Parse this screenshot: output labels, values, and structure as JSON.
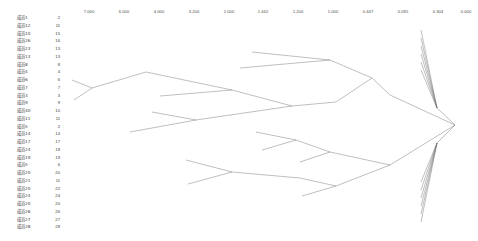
{
  "chart_data": {
    "type": "line",
    "chart_kind": "dendrogram",
    "title": "",
    "subtitle": "",
    "xlabel": "",
    "ylabel": "",
    "orientation": "horizontal-right-root",
    "link_style": "slanted",
    "grid": false,
    "legend": null,
    "line_color": "#6f6f6f",
    "axis": {
      "label": "",
      "direction": "descending-left-to-right",
      "range": [
        7.0,
        0.0
      ],
      "tick_labels": [
        "7.000",
        "6.000",
        "4.000",
        "3.200",
        "2.000",
        "1.442",
        "1.200",
        "1.000",
        "0.447",
        "0.092",
        "0.304",
        "0.000"
      ],
      "tick_values": [
        7.0,
        6.0,
        4.0,
        3.2,
        2.0,
        1.442,
        1.2,
        1.0,
        0.447,
        0.092,
        0.304,
        0.0
      ],
      "tick_x_px": [
        89,
        124,
        159,
        194,
        229,
        263,
        298,
        333,
        368,
        403,
        438,
        466
      ]
    },
    "leaf_count": 28,
    "categories": [
      "成员1",
      "成员12",
      "成员10",
      "成员26",
      "成员23",
      "成员13",
      "成员8",
      "成员4",
      "成员6",
      "成员7",
      "成员3",
      "成员9",
      "成员40",
      "成员11",
      "成员5",
      "成员14",
      "成员17",
      "成员24",
      "成员19",
      "成员5",
      "成员20",
      "成员21",
      "成员20",
      "成员24",
      "成员20",
      "成员26",
      "成员27",
      "成员28"
    ],
    "values": [
      2,
      11,
      15,
      16,
      13,
      13,
      8,
      4,
      6,
      7,
      3,
      9,
      10,
      11,
      2,
      14,
      17,
      18,
      19,
      6,
      20,
      11,
      22,
      24,
      20,
      26,
      27,
      28
    ],
    "series": [
      {
        "name": "leaf-index",
        "values": [
          2,
          11,
          15,
          16,
          13,
          13,
          8,
          4,
          6,
          7,
          3,
          9,
          10,
          11,
          2,
          14,
          17,
          18,
          19,
          6,
          20,
          11,
          22,
          24,
          20,
          26,
          27,
          28
        ]
      }
    ]
  },
  "leaves": [
    {
      "label": "成员1",
      "index": "2"
    },
    {
      "label": "成员12",
      "index": "11"
    },
    {
      "label": "成员10",
      "index": "15"
    },
    {
      "label": "成员26",
      "index": "16"
    },
    {
      "label": "成员23",
      "index": "13"
    },
    {
      "label": "成员13",
      "index": "13"
    },
    {
      "label": "成员8",
      "index": "8"
    },
    {
      "label": "成员4",
      "index": "4"
    },
    {
      "label": "成员6",
      "index": "6"
    },
    {
      "label": "成员7",
      "index": "7"
    },
    {
      "label": "成员3",
      "index": "3"
    },
    {
      "label": "成员9",
      "index": "9"
    },
    {
      "label": "成员40",
      "index": "10"
    },
    {
      "label": "成员11",
      "index": "11"
    },
    {
      "label": "成员5",
      "index": "2"
    },
    {
      "label": "成员14",
      "index": "14"
    },
    {
      "label": "成员17",
      "index": "17"
    },
    {
      "label": "成员24",
      "index": "18"
    },
    {
      "label": "成员19",
      "index": "19"
    },
    {
      "label": "成员5",
      "index": "6"
    },
    {
      "label": "成员20",
      "index": "20"
    },
    {
      "label": "成员21",
      "index": "11"
    },
    {
      "label": "成员20",
      "index": "22"
    },
    {
      "label": "成员24",
      "index": "24"
    },
    {
      "label": "成员20",
      "index": "20"
    },
    {
      "label": "成员26",
      "index": "26"
    },
    {
      "label": "成员27",
      "index": "27"
    },
    {
      "label": "成员28",
      "index": "28"
    }
  ],
  "tree": {
    "root": {
      "x": 455,
      "y": 125
    },
    "segments": [
      [
        455,
        125,
        437,
        108
      ],
      [
        437,
        108,
        421,
        30
      ],
      [
        437,
        108,
        421,
        38
      ],
      [
        437,
        108,
        421,
        46
      ],
      [
        437,
        108,
        421,
        54
      ],
      [
        437,
        108,
        421,
        62
      ],
      [
        437,
        108,
        421,
        70
      ],
      [
        455,
        125,
        437,
        143
      ],
      [
        437,
        143,
        421,
        182
      ],
      [
        437,
        143,
        421,
        190
      ],
      [
        437,
        143,
        421,
        198
      ],
      [
        437,
        143,
        421,
        206
      ],
      [
        437,
        143,
        421,
        214
      ],
      [
        437,
        143,
        421,
        222
      ],
      [
        455,
        125,
        390,
        95
      ],
      [
        455,
        125,
        390,
        165
      ],
      [
        390,
        95,
        372,
        78
      ],
      [
        372,
        78,
        330,
        60
      ],
      [
        372,
        78,
        336,
        102
      ],
      [
        330,
        60,
        240,
        68
      ],
      [
        330,
        60,
        252,
        52
      ],
      [
        336,
        102,
        292,
        106
      ],
      [
        292,
        106,
        196,
        120
      ],
      [
        292,
        106,
        232,
        90
      ],
      [
        232,
        90,
        146,
        72
      ],
      [
        232,
        90,
        160,
        96
      ],
      [
        196,
        120,
        130,
        132
      ],
      [
        196,
        120,
        152,
        112
      ],
      [
        146,
        72,
        92,
        88
      ],
      [
        92,
        88,
        72,
        80
      ],
      [
        92,
        88,
        74,
        100
      ],
      [
        390,
        165,
        330,
        152
      ],
      [
        390,
        165,
        336,
        186
      ],
      [
        330,
        152,
        296,
        140
      ],
      [
        330,
        152,
        300,
        162
      ],
      [
        296,
        140,
        256,
        132
      ],
      [
        296,
        140,
        262,
        150
      ],
      [
        336,
        186,
        300,
        178
      ],
      [
        336,
        186,
        302,
        196
      ],
      [
        300,
        178,
        232,
        172
      ],
      [
        232,
        172,
        186,
        160
      ],
      [
        232,
        172,
        188,
        184
      ]
    ]
  }
}
